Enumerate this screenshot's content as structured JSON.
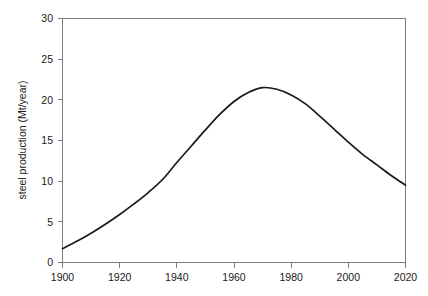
{
  "chart_data": {
    "type": "line",
    "title": "",
    "xlabel": "",
    "ylabel": "steel production (Mt/year)",
    "xlim": [
      1900,
      2020
    ],
    "ylim": [
      0,
      30
    ],
    "xticks": [
      1900,
      1920,
      1940,
      1960,
      1980,
      2000,
      2020
    ],
    "xtick_labels": [
      "1900",
      "1920",
      "1940",
      "1960",
      "1980",
      "2000",
      "2020"
    ],
    "yticks": [
      0,
      5,
      10,
      15,
      20,
      25,
      30
    ],
    "ytick_labels": [
      "0",
      "5",
      "10",
      "15",
      "20",
      "25",
      "30"
    ],
    "grid": false,
    "legend": null,
    "series": [
      {
        "name": "steel production",
        "color": "#1a1a1a",
        "x": [
          1900,
          1905,
          1910,
          1915,
          1920,
          1925,
          1930,
          1935,
          1940,
          1945,
          1950,
          1955,
          1960,
          1965,
          1970,
          1975,
          1980,
          1985,
          1990,
          1995,
          2000,
          2005,
          2010,
          2015,
          2020
        ],
        "values": [
          1.7,
          2.6,
          3.6,
          4.7,
          5.9,
          7.2,
          8.6,
          10.2,
          12.3,
          14.3,
          16.3,
          18.2,
          19.8,
          20.9,
          21.5,
          21.3,
          20.6,
          19.5,
          18.0,
          16.4,
          14.8,
          13.3,
          12.0,
          10.7,
          9.5
        ]
      }
    ],
    "peak": {
      "x": 1970,
      "y": 21.5
    }
  },
  "axes": {
    "y_axis_title": "steel production (Mt/year)"
  }
}
